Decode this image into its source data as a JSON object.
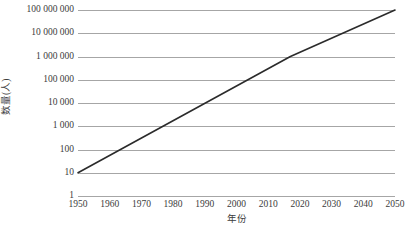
{
  "chart_data": {
    "type": "line",
    "title": "",
    "xlabel": "年份",
    "ylabel": "数量(人)",
    "yscale": "log",
    "ylim": [
      1,
      100000000
    ],
    "xlim": [
      1950,
      2050
    ],
    "grid": true,
    "legend": false,
    "line_color": "#2b2b2b",
    "grid_color": "#a6a6a6",
    "x_tick_labels": [
      "1950",
      "1960",
      "1970",
      "1980",
      "1990",
      "2000",
      "2010",
      "2020",
      "2030",
      "2040",
      "2050"
    ],
    "x_ticks": [
      1950,
      1960,
      1970,
      1980,
      1990,
      2000,
      2010,
      2020,
      2030,
      2040,
      2050
    ],
    "y_tick_labels": [
      "100 000 000",
      "10 000 000",
      "1 000 000",
      "100 000",
      "10 000",
      "1 000",
      "100",
      "10",
      "1"
    ],
    "y_ticks": [
      100000000,
      10000000,
      1000000,
      100000,
      10000,
      1000,
      100,
      10,
      1
    ],
    "series": [
      {
        "name": "数量(人)",
        "x": [
          1950,
          2017,
          2050
        ],
        "values": [
          10,
          1000000,
          100000000
        ]
      }
    ]
  }
}
